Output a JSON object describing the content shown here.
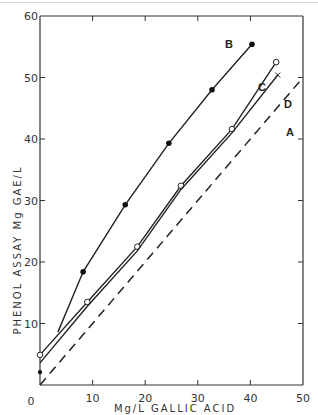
{
  "chart_data": {
    "type": "line",
    "title": "",
    "xlabel": "Mg/L GALLIC ACID",
    "ylabel": "PHENOL ASSAY Mg GAE/L",
    "xlim": [
      0,
      50
    ],
    "ylim": [
      0,
      60
    ],
    "xticks": [
      0,
      10,
      20,
      30,
      40,
      50
    ],
    "yticks": [
      0,
      10,
      20,
      30,
      40,
      50,
      60
    ],
    "grid": false,
    "legend": "inline curve labels",
    "series": [
      {
        "name": "A",
        "style": "dashed",
        "marker": "none",
        "x": [
          0,
          50
        ],
        "y": [
          0,
          50
        ]
      },
      {
        "name": "B",
        "style": "solid",
        "marker": "filled-circle",
        "x": [
          3.4,
          8.2,
          16.2,
          24.5,
          32.7,
          40.3
        ],
        "y": [
          8.6,
          18.4,
          29.3,
          39.3,
          48.0,
          55.4
        ]
      },
      {
        "name": "C",
        "style": "solid",
        "marker": "open-circle",
        "x": [
          0,
          9,
          18.5,
          26.8,
          36.5,
          44.9
        ],
        "y": [
          4.9,
          13.5,
          22.5,
          32.4,
          41.6,
          52.5
        ]
      },
      {
        "name": "D",
        "style": "solid",
        "marker": "x",
        "x": [
          0,
          9,
          18.5,
          26.8,
          36.5,
          45.2
        ],
        "y": [
          3.6,
          12.8,
          21.8,
          31.8,
          41.0,
          50.4
        ]
      }
    ]
  },
  "labels": {
    "y_axis_title": "PHENOL   ASSAY   Mg GAE/L",
    "x_axis_title": "Mg/L   GALLIC   ACID",
    "x_ticks": [
      "0",
      "10",
      "20",
      "30",
      "40",
      "50"
    ],
    "y_ticks": [
      "10",
      "20",
      "30",
      "40",
      "50",
      "60"
    ],
    "curve_A": "A",
    "curve_B": "B",
    "curve_C": "C",
    "curve_D": "D",
    "origin": "0"
  }
}
